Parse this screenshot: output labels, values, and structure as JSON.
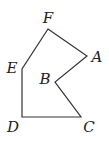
{
  "diagram": {
    "type": "polygon",
    "stroke_color": "#333333",
    "background": "#ffffff",
    "vertices": [
      {
        "name": "A",
        "x": 87,
        "y": 56,
        "label_x": 97,
        "label_y": 62
      },
      {
        "name": "B",
        "x": 55,
        "y": 82,
        "label_x": 45,
        "label_y": 84
      },
      {
        "name": "C",
        "x": 81,
        "y": 117,
        "label_x": 89,
        "label_y": 132
      },
      {
        "name": "D",
        "x": 22,
        "y": 117,
        "label_x": 13,
        "label_y": 132
      },
      {
        "name": "E",
        "x": 22,
        "y": 69,
        "label_x": 12,
        "label_y": 73
      },
      {
        "name": "F",
        "x": 48,
        "y": 29,
        "label_x": 48,
        "label_y": 23
      }
    ],
    "edges": [
      [
        "F",
        "A"
      ],
      [
        "A",
        "B"
      ],
      [
        "B",
        "C"
      ],
      [
        "C",
        "D"
      ],
      [
        "D",
        "E"
      ],
      [
        "E",
        "F"
      ]
    ]
  }
}
